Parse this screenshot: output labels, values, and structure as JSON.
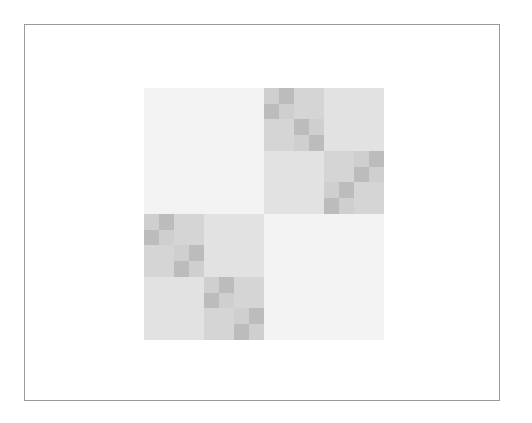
{
  "diagram": {
    "type": "hierarchical-block-matrix",
    "colors": {
      "background": "#ffffff",
      "frame_border": "#9a9a9a",
      "level1": "#f3f3f3",
      "level2": "#e2e2e2",
      "level3": "#d5d5d5",
      "level4_light": "#cfcfcf",
      "level4_dark": "#bcbcbc"
    },
    "frame": {
      "x": 24,
      "y": 24,
      "w": 476,
      "h": 377
    },
    "matrix": {
      "x": 144,
      "y": 88,
      "w": 240,
      "h": 252
    },
    "blocks": [
      {
        "x": 0,
        "y": 0,
        "w": 120,
        "h": 126,
        "c": "level1"
      },
      {
        "x": 120,
        "y": 126,
        "w": 120,
        "h": 126,
        "c": "level1"
      },
      {
        "x": 180,
        "y": 0,
        "w": 60,
        "h": 63,
        "c": "level2"
      },
      {
        "x": 120,
        "y": 63,
        "w": 60,
        "h": 63,
        "c": "level2"
      },
      {
        "x": 60,
        "y": 126,
        "w": 60,
        "h": 63,
        "c": "level2"
      },
      {
        "x": 0,
        "y": 189,
        "w": 60,
        "h": 63,
        "c": "level2"
      },
      {
        "x": 150,
        "y": 0,
        "w": 30,
        "h": 31,
        "c": "level3"
      },
      {
        "x": 120,
        "y": 31,
        "w": 30,
        "h": 32,
        "c": "level3"
      },
      {
        "x": 180,
        "y": 63,
        "w": 30,
        "h": 31,
        "c": "level3"
      },
      {
        "x": 210,
        "y": 94,
        "w": 30,
        "h": 32,
        "c": "level3"
      },
      {
        "x": 30,
        "y": 126,
        "w": 30,
        "h": 31,
        "c": "level3"
      },
      {
        "x": 0,
        "y": 157,
        "w": 30,
        "h": 32,
        "c": "level3"
      },
      {
        "x": 90,
        "y": 189,
        "w": 30,
        "h": 31,
        "c": "level3"
      },
      {
        "x": 60,
        "y": 220,
        "w": 30,
        "h": 32,
        "c": "level3"
      },
      {
        "x": 120,
        "y": 0,
        "w": 15,
        "h": 16,
        "c": "level4_light"
      },
      {
        "x": 135,
        "y": 0,
        "w": 15,
        "h": 16,
        "c": "level4_dark"
      },
      {
        "x": 120,
        "y": 16,
        "w": 15,
        "h": 15,
        "c": "level4_dark"
      },
      {
        "x": 135,
        "y": 16,
        "w": 15,
        "h": 15,
        "c": "level4_light"
      },
      {
        "x": 150,
        "y": 31,
        "w": 15,
        "h": 16,
        "c": "level4_dark"
      },
      {
        "x": 165,
        "y": 31,
        "w": 15,
        "h": 16,
        "c": "level4_light"
      },
      {
        "x": 150,
        "y": 47,
        "w": 15,
        "h": 16,
        "c": "level4_light"
      },
      {
        "x": 165,
        "y": 47,
        "w": 15,
        "h": 16,
        "c": "level4_dark"
      },
      {
        "x": 210,
        "y": 63,
        "w": 15,
        "h": 16,
        "c": "level4_light"
      },
      {
        "x": 225,
        "y": 63,
        "w": 15,
        "h": 16,
        "c": "level4_dark"
      },
      {
        "x": 210,
        "y": 79,
        "w": 15,
        "h": 15,
        "c": "level4_dark"
      },
      {
        "x": 225,
        "y": 79,
        "w": 15,
        "h": 15,
        "c": "level4_light"
      },
      {
        "x": 180,
        "y": 94,
        "w": 15,
        "h": 16,
        "c": "level4_light"
      },
      {
        "x": 195,
        "y": 94,
        "w": 15,
        "h": 16,
        "c": "level4_dark"
      },
      {
        "x": 180,
        "y": 110,
        "w": 15,
        "h": 16,
        "c": "level4_dark"
      },
      {
        "x": 195,
        "y": 110,
        "w": 15,
        "h": 16,
        "c": "level4_light"
      },
      {
        "x": 0,
        "y": 126,
        "w": 15,
        "h": 16,
        "c": "level4_light"
      },
      {
        "x": 15,
        "y": 126,
        "w": 15,
        "h": 16,
        "c": "level4_dark"
      },
      {
        "x": 0,
        "y": 142,
        "w": 15,
        "h": 15,
        "c": "level4_dark"
      },
      {
        "x": 15,
        "y": 142,
        "w": 15,
        "h": 15,
        "c": "level4_light"
      },
      {
        "x": 30,
        "y": 157,
        "w": 15,
        "h": 16,
        "c": "level4_light"
      },
      {
        "x": 45,
        "y": 157,
        "w": 15,
        "h": 16,
        "c": "level4_dark"
      },
      {
        "x": 30,
        "y": 173,
        "w": 15,
        "h": 16,
        "c": "level4_dark"
      },
      {
        "x": 45,
        "y": 173,
        "w": 15,
        "h": 16,
        "c": "level4_light"
      },
      {
        "x": 60,
        "y": 189,
        "w": 15,
        "h": 16,
        "c": "level4_light"
      },
      {
        "x": 75,
        "y": 189,
        "w": 15,
        "h": 16,
        "c": "level4_dark"
      },
      {
        "x": 60,
        "y": 205,
        "w": 15,
        "h": 15,
        "c": "level4_dark"
      },
      {
        "x": 75,
        "y": 205,
        "w": 15,
        "h": 15,
        "c": "level4_light"
      },
      {
        "x": 90,
        "y": 220,
        "w": 15,
        "h": 16,
        "c": "level4_light"
      },
      {
        "x": 105,
        "y": 220,
        "w": 15,
        "h": 16,
        "c": "level4_dark"
      },
      {
        "x": 90,
        "y": 236,
        "w": 15,
        "h": 16,
        "c": "level4_dark"
      },
      {
        "x": 105,
        "y": 236,
        "w": 15,
        "h": 16,
        "c": "level4_light"
      }
    ]
  }
}
